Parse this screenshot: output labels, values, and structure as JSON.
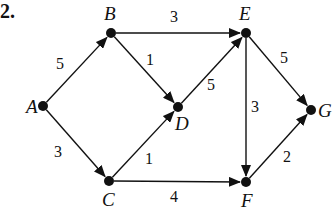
{
  "problem": {
    "number": "2."
  },
  "graph": {
    "type": "directed-weighted",
    "nodes": [
      {
        "id": "A",
        "label": "A",
        "x": 43,
        "y": 106,
        "lx": 26,
        "ly": 113
      },
      {
        "id": "B",
        "label": "B",
        "x": 111,
        "y": 33,
        "lx": 104,
        "ly": 20
      },
      {
        "id": "C",
        "label": "C",
        "x": 109,
        "y": 181,
        "lx": 102,
        "ly": 206
      },
      {
        "id": "D",
        "label": "D",
        "x": 178,
        "y": 107,
        "lx": 175,
        "ly": 130
      },
      {
        "id": "E",
        "label": "E",
        "x": 246,
        "y": 33,
        "lx": 239,
        "ly": 20
      },
      {
        "id": "F",
        "label": "F",
        "x": 246,
        "y": 182,
        "lx": 241,
        "ly": 207
      },
      {
        "id": "G",
        "label": "G",
        "x": 311,
        "y": 110,
        "lx": 318,
        "ly": 117
      }
    ],
    "edges": [
      {
        "from": "A",
        "to": "B",
        "weight": "5",
        "wx": 60,
        "wy": 69
      },
      {
        "from": "A",
        "to": "C",
        "weight": "3",
        "wx": 58,
        "wy": 157
      },
      {
        "from": "B",
        "to": "E",
        "weight": "3",
        "wx": 174,
        "wy": 22
      },
      {
        "from": "B",
        "to": "D",
        "weight": "1",
        "wx": 150,
        "wy": 65
      },
      {
        "from": "C",
        "to": "D",
        "weight": "1",
        "wx": 149,
        "wy": 164
      },
      {
        "from": "C",
        "to": "F",
        "weight": "4",
        "wx": 174,
        "wy": 202
      },
      {
        "from": "D",
        "to": "E",
        "weight": "5",
        "wx": 211,
        "wy": 90
      },
      {
        "from": "E",
        "to": "G",
        "weight": "5",
        "wx": 284,
        "wy": 63
      },
      {
        "from": "E",
        "to": "F",
        "weight": "3",
        "wx": 255,
        "wy": 112
      },
      {
        "from": "F",
        "to": "G",
        "weight": "2",
        "wx": 287,
        "wy": 162
      }
    ]
  },
  "colors": {
    "ink": "#111111",
    "background": "#ffffff"
  }
}
